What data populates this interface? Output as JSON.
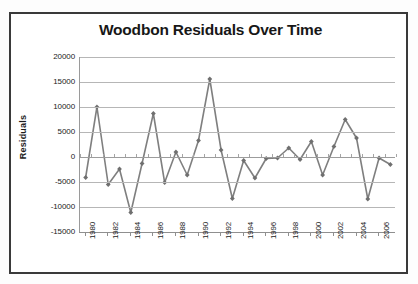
{
  "chart_data": {
    "type": "line",
    "title": "Woodbon Residuals Over Time",
    "xlabel": "",
    "ylabel": "Residuals",
    "ylim": [
      -15000,
      20000
    ],
    "ytick_values": [
      20000,
      15000,
      10000,
      5000,
      0,
      -5000,
      -10000,
      -15000
    ],
    "ytick_labels": [
      "20000",
      "15000",
      "10000",
      "5000",
      "0",
      "-5000",
      "-10000",
      "-15000"
    ],
    "xlim": [
      1980,
      2007
    ],
    "xtick_labels": [
      "1980",
      "1982",
      "1984",
      "1986",
      "1988",
      "1990",
      "1992",
      "1994",
      "1996",
      "1998",
      "2000",
      "2002",
      "2004",
      "2006"
    ],
    "grid": "horizontal",
    "legend": "none",
    "x": [
      1980,
      1981,
      1982,
      1983,
      1984,
      1985,
      1986,
      1987,
      1988,
      1989,
      1990,
      1991,
      1992,
      1993,
      1994,
      1995,
      1996,
      1997,
      1998,
      1999,
      2000,
      2001,
      2002,
      2003,
      2004,
      2005,
      2006,
      2007
    ],
    "categories": [
      "1980",
      "1981",
      "1982",
      "1983",
      "1984",
      "1985",
      "1986",
      "1987",
      "1988",
      "1989",
      "1990",
      "1991",
      "1992",
      "1993",
      "1994",
      "1995",
      "1996",
      "1997",
      "1998",
      "1999",
      "2000",
      "2001",
      "2002",
      "2003",
      "2004",
      "2005",
      "2006",
      "2007"
    ],
    "values": [
      -4100,
      10000,
      -5500,
      -2400,
      -11100,
      -1300,
      8700,
      -5100,
      1000,
      -3600,
      3300,
      15600,
      1400,
      -8300,
      -700,
      -4200,
      -300,
      -200,
      1800,
      -500,
      3100,
      -3600,
      2100,
      7500,
      3800,
      -8400,
      -200,
      -1500
    ],
    "series": [
      {
        "name": "Residuals",
        "marker": "diamond",
        "line_color": "#7f7f7f",
        "marker_color": "#6f6f6f",
        "values": [
          -4100,
          10000,
          -5500,
          -2400,
          -11100,
          -1300,
          8700,
          -5100,
          1000,
          -3600,
          3300,
          15600,
          1400,
          -8300,
          -700,
          -4200,
          -300,
          -200,
          1800,
          -500,
          3100,
          -3600,
          2100,
          7500,
          3800,
          -8400,
          -200,
          -1500
        ]
      }
    ]
  },
  "style": {
    "frame_border_color": "#3a3a3a",
    "gridline_color": "#b6b6b6",
    "axis_color": "#8f8f8f",
    "title_color": "#171717",
    "tick_text_color": "#222222",
    "plot_background": "#ffffff",
    "page_background": "#fdfdfd"
  }
}
